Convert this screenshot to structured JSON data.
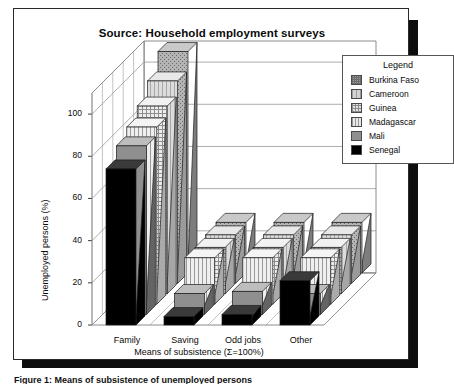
{
  "figure": {
    "title": "Source: Household employment surveys",
    "caption": "Figure 1: Means of subsistence of unemployed persons"
  },
  "legend": {
    "title": "Legend",
    "entries": [
      {
        "label": "Burkina Faso",
        "pattern": "dense-dots",
        "color": "#9a9a9a"
      },
      {
        "label": "Cameroon",
        "pattern": "light-grid",
        "color": "#d2d2d2"
      },
      {
        "label": "Guinea",
        "pattern": "checker",
        "color": "#e2e2e2"
      },
      {
        "label": "Madagascar",
        "pattern": "vertical-lines",
        "color": "#e8e8e8"
      },
      {
        "label": "Mali",
        "pattern": "solid-grey",
        "color": "#8f8f8f"
      },
      {
        "label": "Senegal",
        "pattern": "solid-black",
        "color": "#000000"
      }
    ]
  },
  "axes": {
    "ylabel": "Unemployed persons (%)",
    "xlabel": "Means of subsistence (Σ=100%)",
    "yticks": [
      "0",
      "20",
      "40",
      "60",
      "80",
      "100"
    ],
    "xticks": [
      "Family",
      "Saving",
      "Odd jobs",
      "Other"
    ]
  },
  "chart_data": {
    "type": "bar",
    "title": "Source: Household employment surveys",
    "xlabel": "Means of subsistence (Σ=100%)",
    "ylabel": "Unemployed persons (%)",
    "ylim": [
      0,
      110
    ],
    "yticks": [
      0,
      20,
      40,
      60,
      80,
      100
    ],
    "grid": true,
    "legend_position": "right",
    "projection": "3d-receding",
    "categories": [
      "Family",
      "Saving",
      "Odd jobs",
      "Other"
    ],
    "series": [
      {
        "name": "Burkina Faso",
        "values": [
          105,
          24,
          24,
          24
        ]
      },
      {
        "name": "Cameroon",
        "values": [
          96,
          23,
          23,
          23
        ]
      },
      {
        "name": "Guinea",
        "values": [
          89,
          22,
          22,
          22
        ]
      },
      {
        "name": "Madagascar",
        "values": [
          84,
          22,
          22,
          22
        ]
      },
      {
        "name": "Mali",
        "values": [
          80,
          10,
          11,
          10
        ]
      },
      {
        "name": "Senegal",
        "values": [
          74,
          4,
          5,
          21
        ]
      }
    ]
  }
}
